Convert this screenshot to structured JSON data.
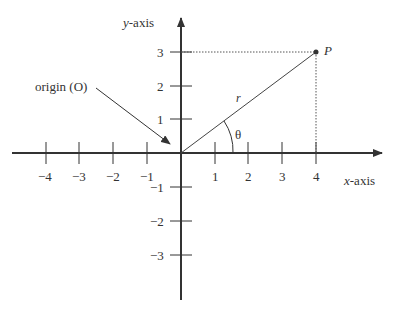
{
  "diagram": {
    "y_axis_label_var": "y",
    "y_axis_label_rest": "-axis",
    "x_axis_label_var": "x",
    "x_axis_label_rest": "-axis",
    "origin_label": "origin (O)",
    "point_label": "P",
    "radius_label": "r",
    "angle_label": "θ",
    "x_ticks": [
      "−4",
      "−3",
      "−2",
      "−1",
      "1",
      "2",
      "3",
      "4"
    ],
    "y_ticks": [
      "3",
      "2",
      "1",
      "−1",
      "−2",
      "−3"
    ],
    "point": {
      "x": 4,
      "y": 3
    },
    "colors": {
      "line": "#333333",
      "text": "#333333"
    }
  }
}
